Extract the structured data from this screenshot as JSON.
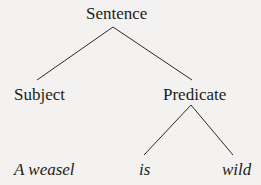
{
  "diagram": {
    "type": "parse-tree",
    "root": {
      "label": "Sentence",
      "children": [
        {
          "label": "Subject",
          "children": [
            {
              "label": "A weasel",
              "leaf": true
            }
          ]
        },
        {
          "label": "Predicate",
          "children": [
            {
              "label": "is",
              "leaf": true
            },
            {
              "label": "wild",
              "leaf": true
            }
          ]
        }
      ]
    },
    "nodes": {
      "sentence": "Sentence",
      "subject": "Subject",
      "predicate": "Predicate",
      "leaf_subject": "A weasel",
      "leaf_verb": "is",
      "leaf_adj": "wild"
    },
    "colors": {
      "line": "#2a2a2a",
      "text": "#1c1c1c",
      "background": "#f3f2f0"
    }
  }
}
